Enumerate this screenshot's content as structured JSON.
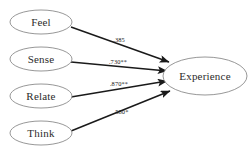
{
  "diagram": {
    "type": "path-diagram",
    "background_color": "#ffffff",
    "node_stroke_color": "#8b8b8b",
    "edge_color": "#1a1a1a",
    "text_color": "#2b2b2b",
    "predictors": [
      {
        "id": "feel",
        "label": "Feel",
        "cx": 41,
        "cy": 22,
        "rx": 31,
        "ry": 12
      },
      {
        "id": "sense",
        "label": "Sense",
        "cx": 41,
        "cy": 59,
        "rx": 31,
        "ry": 12
      },
      {
        "id": "relate",
        "label": "Relate",
        "cx": 41,
        "cy": 96,
        "rx": 31,
        "ry": 12
      },
      {
        "id": "think",
        "label": "Think",
        "cx": 41,
        "cy": 133,
        "rx": 31,
        "ry": 12
      }
    ],
    "outcome": {
      "id": "experience",
      "label": "Experience",
      "cx": 205,
      "cy": 76,
      "rx": 42,
      "ry": 19
    },
    "edges": [
      {
        "id": "feel-to-experience",
        "from": "Feel",
        "to": "Experience",
        "label": ".385",
        "x1": 71,
        "y1": 27,
        "x2": 169,
        "y2": 62,
        "lx": 119,
        "ly": 41
      },
      {
        "id": "sense-to-experience",
        "from": "Sense",
        "to": "Experience",
        "label": ".730**",
        "x1": 71,
        "y1": 62,
        "x2": 167,
        "y2": 71,
        "lx": 118,
        "ly": 63
      },
      {
        "id": "relate-to-experience",
        "from": "Relate",
        "to": "Experience",
        "label": ".870**",
        "x1": 71,
        "y1": 97,
        "x2": 167,
        "y2": 81,
        "lx": 119,
        "ly": 85
      },
      {
        "id": "think-to-experience",
        "from": "Think",
        "to": "Experience",
        "label": ".580*",
        "x1": 71,
        "y1": 131,
        "x2": 170,
        "y2": 91,
        "lx": 121,
        "ly": 113
      }
    ]
  }
}
